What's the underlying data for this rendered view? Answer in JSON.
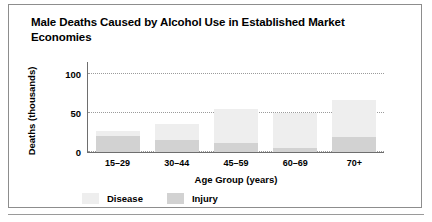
{
  "figure": {
    "title": "Male Deaths Caused by Alcohol Use in Established Market Economies"
  },
  "legend": {
    "items": [
      {
        "label": "Disease",
        "color": "#eeeeee"
      },
      {
        "label": "Injury",
        "color": "#d2d2d2"
      }
    ]
  },
  "chart_data": {
    "type": "bar",
    "stacked": true,
    "title": "Male Deaths Caused by Alcohol Use in Established Market Economies",
    "xlabel": "Age Group (years)",
    "ylabel": "Deaths (thousands)",
    "categories": [
      "15–29",
      "30–44",
      "45–59",
      "60–69",
      "70+"
    ],
    "series": [
      {
        "name": "Injury",
        "color": "#d2d2d2",
        "values": [
          20,
          16,
          11,
          5,
          19
        ]
      },
      {
        "name": "Disease",
        "color": "#eeeeee",
        "values": [
          7,
          20,
          44,
          45,
          48
        ]
      }
    ],
    "totals": [
      27,
      36,
      55,
      50,
      67
    ],
    "ylim": [
      0,
      110
    ],
    "yticks": [
      0,
      50,
      100
    ],
    "ytick_labels": [
      "0",
      "50",
      "100"
    ],
    "grid": true,
    "legend_position": "bottom"
  }
}
